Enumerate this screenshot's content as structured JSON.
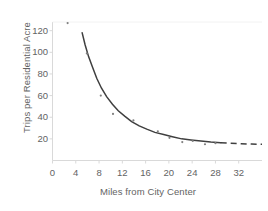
{
  "chart_data": {
    "type": "scatter",
    "title": "",
    "subtitle": "",
    "xlabel": "Miles from City Center",
    "ylabel": "Trips per Residential Acre",
    "xlim": [
      0,
      36
    ],
    "ylim": [
      0,
      128
    ],
    "xticks": [
      0,
      4,
      8,
      12,
      16,
      20,
      24,
      28,
      32
    ],
    "xtick_labels": [
      "0",
      "4",
      "8",
      "12",
      "16",
      "20",
      "24",
      "28",
      "32"
    ],
    "yticks": [
      20,
      40,
      60,
      80,
      100,
      120
    ],
    "ytick_labels": [
      "20",
      "40",
      "60",
      "80",
      "100",
      "120"
    ],
    "grid": false,
    "legend": "none",
    "axis_color": "#d9d9d9",
    "text_color": "#636363",
    "point_color": "#808080",
    "curve_color": "#3f3f3f",
    "background": "#ffffff",
    "points": [
      {
        "x": 2.6,
        "y": 127
      },
      {
        "x": 5.9,
        "y": 99
      },
      {
        "x": 8.3,
        "y": 60
      },
      {
        "x": 10.4,
        "y": 43
      },
      {
        "x": 13.9,
        "y": 37
      },
      {
        "x": 18.1,
        "y": 27
      },
      {
        "x": 20.1,
        "y": 21
      },
      {
        "x": 22.3,
        "y": 17
      },
      {
        "x": 24.1,
        "y": 18
      },
      {
        "x": 26.2,
        "y": 15
      },
      {
        "x": 28.0,
        "y": 16
      }
    ],
    "fit_curve": {
      "style": "solid-then-dashed",
      "solid_x_range": [
        5.1,
        28.9
      ],
      "dashed_x_range": [
        28.9,
        36.0
      ],
      "x": [
        5.1,
        5.6,
        6.2,
        6.9,
        7.6,
        8.4,
        9.3,
        10.3,
        11.3,
        12.4,
        13.6,
        14.9,
        16.2,
        17.6,
        19.1,
        20.6,
        22.2,
        23.8,
        25.5,
        27.2,
        28.9,
        30.6,
        32.4,
        34.2,
        36.0
      ],
      "y": [
        118,
        107,
        96,
        86,
        76,
        67,
        59,
        52,
        46,
        41,
        36,
        32,
        29,
        26,
        24,
        22,
        20,
        19,
        18,
        17,
        16.4,
        15.9,
        15.5,
        15.2,
        15.0
      ]
    }
  }
}
